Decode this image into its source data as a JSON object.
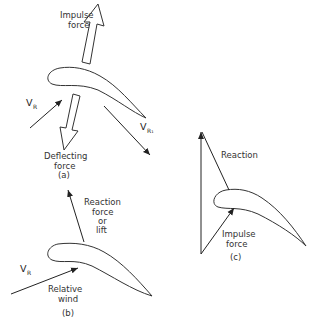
{
  "figure": {
    "panel_a": {
      "caption": "(a)",
      "impulse_label_line1": "Impulse",
      "impulse_label_line2": "force",
      "deflecting_label_line1": "Deflecting",
      "deflecting_label_line2": "force",
      "inlet_velocity": "V",
      "inlet_velocity_sub": "R",
      "outlet_velocity": "V",
      "outlet_velocity_sub": "R₁"
    },
    "panel_b": {
      "caption": "(b)",
      "reaction_line1": "Reaction",
      "reaction_line2": "force",
      "reaction_line3": "or",
      "reaction_line4": "lift",
      "velocity": "V",
      "velocity_sub": "R",
      "wind_line1": "Relative",
      "wind_line2": "wind"
    },
    "panel_c": {
      "caption": "(c)",
      "reaction_label": "Reaction",
      "impulse_line1": "Impulse",
      "impulse_line2": "force"
    }
  }
}
